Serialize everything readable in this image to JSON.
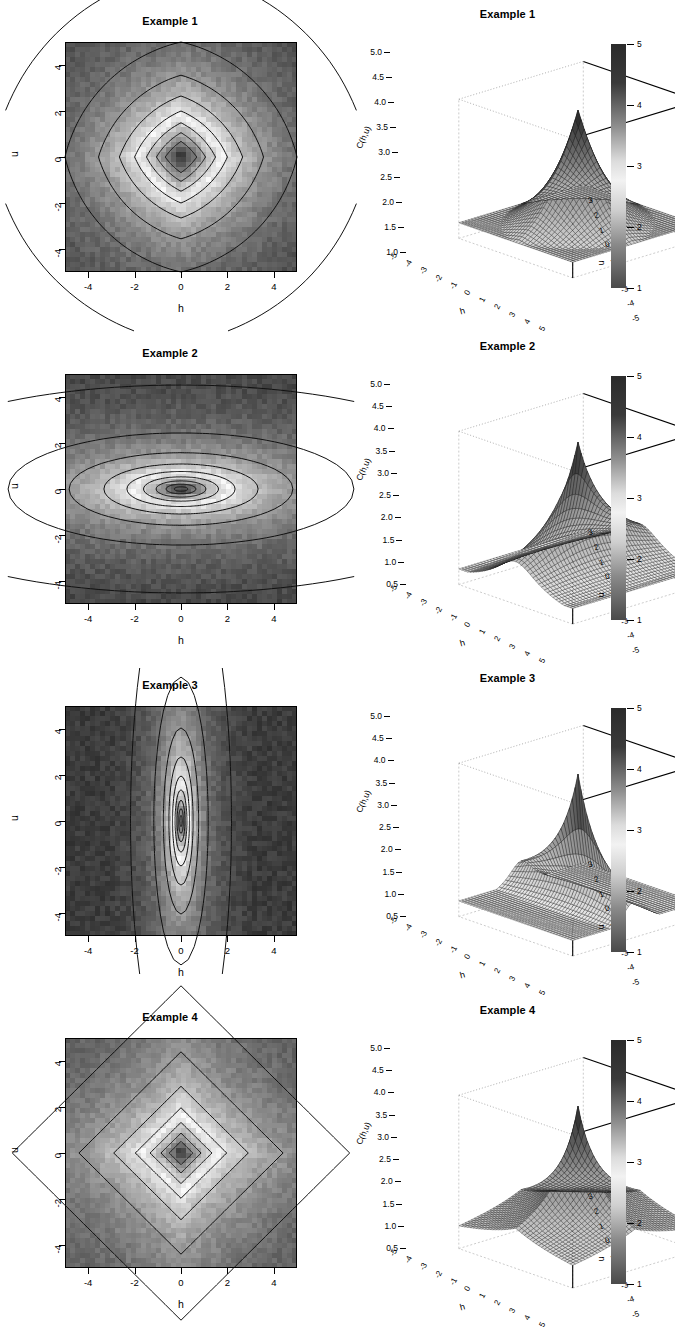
{
  "figure": {
    "panel_count": 8,
    "rows": 4,
    "columns": 2,
    "left_column_type": "filled contour plot",
    "right_column_type": "3D perspective surface plot"
  },
  "axes_labels": {
    "x": "h",
    "y": "u",
    "z": "C(h,u)"
  },
  "contour_axis": {
    "x_ticks": [
      "-4",
      "-2",
      "0",
      "2",
      "4"
    ],
    "y_ticks": [
      "-4",
      "-2",
      "0",
      "2",
      "4"
    ],
    "x_values": [
      -4,
      -2,
      0,
      2,
      4
    ],
    "y_values": [
      -4,
      -2,
      0,
      2,
      4
    ],
    "xlim": [
      -5,
      5
    ],
    "ylim": [
      -5,
      5
    ]
  },
  "persp_axis": {
    "h_ticks": [
      "-5",
      "-4",
      "-3",
      "-2",
      "-1",
      "0",
      "1",
      "2",
      "3",
      "4",
      "5"
    ],
    "u_ticks": [
      "3",
      "2",
      "1",
      "0",
      "-1",
      "-2",
      "-3",
      "-4",
      "-5"
    ],
    "h_label": "h",
    "u_label": "u",
    "z_label": "C(h,u)"
  },
  "colorbar": {
    "ticks": [
      "1",
      "2",
      "3",
      "4",
      "5"
    ],
    "values": [
      1,
      2,
      3,
      4,
      5
    ],
    "min": 1,
    "max": 5,
    "dark_color": "#2b2b2b",
    "light_color": "#f2f2f2"
  },
  "panels": [
    {
      "index": 1,
      "title": "Example 1",
      "contour_title": "Example 1",
      "persp_title": "Example 1",
      "z_ticks": [
        "1.0",
        "1.5",
        "2.0",
        "2.5",
        "3.0",
        "3.5",
        "4.0",
        "4.5",
        "5.0"
      ],
      "z_values": [
        1.0,
        1.5,
        2.0,
        2.5,
        3.0,
        3.5,
        4.0,
        4.5,
        5.0
      ],
      "zlim": [
        1.0,
        5.0
      ],
      "contour_levels": [
        "0.5",
        "1",
        "1.5",
        "2",
        "2.5",
        "3",
        "3.5",
        "4"
      ],
      "shape": "diamond",
      "anisotropy_h": 1.0,
      "anisotropy_u": 1.0,
      "peak_sharpness": 1.0,
      "surface_peak": 5.0,
      "surface_floor": 1.0,
      "description": "symmetric separable covariance, rounded diamond contours"
    },
    {
      "index": 2,
      "title": "Example 2",
      "contour_title": "Example 2",
      "persp_title": "Example 2",
      "z_ticks": [
        "0.5",
        "1.0",
        "1.5",
        "2.0",
        "2.5",
        "3.0",
        "3.5",
        "4.0",
        "4.5",
        "5.0"
      ],
      "z_values": [
        0.5,
        1.0,
        1.5,
        2.0,
        2.5,
        3.0,
        3.5,
        4.0,
        4.5,
        5.0
      ],
      "zlim": [
        0.5,
        5.0
      ],
      "contour_levels": [
        "0.5",
        "1",
        "1.5",
        "2",
        "2.5",
        "3",
        "3.5",
        "4",
        "4.5"
      ],
      "shape": "ellipse-horizontal",
      "anisotropy_h": 2.6,
      "anisotropy_u": 0.85,
      "peak_sharpness": 2.0,
      "surface_peak": 5.0,
      "surface_floor": 0.5,
      "description": "elongated in h, narrow in u, sharp ridge peak"
    },
    {
      "index": 3,
      "title": "Example 3",
      "contour_title": "Example 3",
      "persp_title": "Example 3",
      "z_ticks": [
        "0.5",
        "1.0",
        "1.5",
        "2.0",
        "2.5",
        "3.0",
        "3.5",
        "4.0",
        "4.5",
        "5.0"
      ],
      "z_values": [
        0.5,
        1.0,
        1.5,
        2.0,
        2.5,
        3.0,
        3.5,
        4.0,
        4.5,
        5.0
      ],
      "zlim": [
        0.5,
        5.0
      ],
      "contour_levels": [
        "0.5",
        "1",
        "1.5",
        "2",
        "2.5",
        "3",
        "3.5",
        "4",
        "4.5"
      ],
      "shape": "ellipse-vertical",
      "anisotropy_h": 0.45,
      "anisotropy_u": 2.4,
      "peak_sharpness": 2.2,
      "surface_peak": 5.0,
      "surface_floor": 0.5,
      "description": "narrow in h, elongated in u, very sharp peak"
    },
    {
      "index": 4,
      "title": "Example 4",
      "contour_title": "Example 4",
      "persp_title": "Example 4",
      "z_ticks": [
        "0.5",
        "1.0",
        "1.5",
        "2.0",
        "2.5",
        "3.0",
        "3.5",
        "4.0",
        "4.5",
        "5.0"
      ],
      "z_values": [
        0.5,
        1.0,
        1.5,
        2.0,
        2.5,
        3.0,
        3.5,
        4.0,
        4.5,
        5.0
      ],
      "zlim": [
        0.5,
        5.0
      ],
      "contour_levels": [
        "0.5",
        "1",
        "1.5",
        "2",
        "2.5",
        "3",
        "3.5",
        "4"
      ],
      "shape": "diamond-sharp",
      "anisotropy_h": 1.0,
      "anisotropy_u": 1.0,
      "peak_sharpness": 1.45,
      "surface_peak": 5.0,
      "surface_floor": 0.5,
      "description": "symmetric sharp diamond contours, peaked non-separable surface"
    }
  ],
  "chart_data": {
    "type": "heatmap",
    "xlabel": "h",
    "ylabel": "u",
    "zlabel": "C(h,u)",
    "xlim": [
      -5,
      5
    ],
    "ylim": [
      -5,
      5
    ],
    "zlim": [
      0.5,
      5
    ],
    "grid": false,
    "legend": "colorbar-right",
    "colormap": "gray-inverted",
    "series": [
      {
        "name": "Example 1",
        "contour_levels": [
          0.5,
          1,
          1.5,
          2,
          2.5,
          3,
          3.5,
          4
        ],
        "peak_value": 5.0,
        "peak_location": [
          0,
          0
        ],
        "range_h": 2.4,
        "range_u": 2.4
      },
      {
        "name": "Example 2",
        "contour_levels": [
          0.5,
          1,
          1.5,
          2,
          2.5,
          3,
          3.5,
          4,
          4.5
        ],
        "peak_value": 5.0,
        "peak_location": [
          0,
          0
        ],
        "range_h": 6.2,
        "range_u": 2.0
      },
      {
        "name": "Example 3",
        "contour_levels": [
          0.5,
          1,
          1.5,
          2,
          2.5,
          3,
          3.5,
          4,
          4.5
        ],
        "peak_value": 5.0,
        "peak_location": [
          0,
          0
        ],
        "range_h": 1.1,
        "range_u": 5.8
      },
      {
        "name": "Example 4",
        "contour_levels": [
          0.5,
          1,
          1.5,
          2,
          2.5,
          3,
          3.5,
          4
        ],
        "peak_value": 5.0,
        "peak_location": [
          0,
          0
        ],
        "range_h": 1.7,
        "range_u": 1.7
      }
    ]
  }
}
